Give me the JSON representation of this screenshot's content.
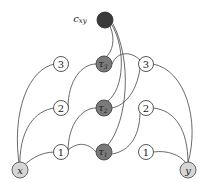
{
  "diagram": {
    "type": "graph",
    "nodes": {
      "cxy": {
        "label": "c",
        "sub": "xy",
        "style": "black"
      },
      "tau3": {
        "label": "τ",
        "sub": "3",
        "style": "dark"
      },
      "tau2": {
        "label": "τ",
        "sub": "2",
        "style": "dark"
      },
      "tau1": {
        "label": "τ",
        "sub": "1",
        "style": "dark"
      },
      "l3": {
        "label": "3",
        "style": "white"
      },
      "l2": {
        "label": "2",
        "style": "white"
      },
      "l1": {
        "label": "1",
        "style": "white"
      },
      "r3": {
        "label": "3",
        "style": "white"
      },
      "r2": {
        "label": "2",
        "style": "white"
      },
      "r1": {
        "label": "1",
        "style": "white"
      },
      "x": {
        "label": "x",
        "style": "light"
      },
      "y": {
        "label": "y",
        "style": "light"
      }
    },
    "edges": [
      [
        "x",
        "l3"
      ],
      [
        "x",
        "l2"
      ],
      [
        "x",
        "l1"
      ],
      [
        "l2",
        "tau3"
      ],
      [
        "l1",
        "tau2"
      ],
      [
        "l1",
        "tau1"
      ],
      [
        "tau3",
        "r3"
      ],
      [
        "tau2",
        "r3"
      ],
      [
        "tau1",
        "r2"
      ],
      [
        "r3",
        "y"
      ],
      [
        "r2",
        "y"
      ],
      [
        "r1",
        "y"
      ],
      [
        "cxy",
        "tau3"
      ],
      [
        "cxy",
        "tau2"
      ],
      [
        "cxy",
        "tau1"
      ]
    ]
  }
}
